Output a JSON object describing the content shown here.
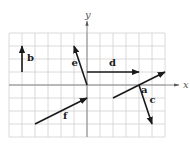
{
  "figure": {
    "axes": {
      "x_label": "x",
      "y_label": "y"
    },
    "grid": {
      "x_min": -6,
      "x_max": 6,
      "y_min": -4,
      "y_max": 4
    },
    "vectors": [
      {
        "name": "a",
        "from": [
          2,
          -1
        ],
        "to": [
          6,
          1
        ]
      },
      {
        "name": "b",
        "from": [
          -5,
          1
        ],
        "to": [
          -5,
          3
        ]
      },
      {
        "name": "c",
        "from": [
          4,
          0
        ],
        "to": [
          5,
          -3
        ]
      },
      {
        "name": "d",
        "from": [
          0,
          1
        ],
        "to": [
          4,
          1
        ]
      },
      {
        "name": "e",
        "from": [
          0,
          0
        ],
        "to": [
          -1,
          3
        ]
      },
      {
        "name": "f",
        "from": [
          -4,
          -3
        ],
        "to": [
          0,
          -1
        ]
      }
    ],
    "colors": {
      "vector": "#1a1a1a",
      "grid": "#d0d0d0",
      "axis": "#7a7a7a"
    }
  }
}
